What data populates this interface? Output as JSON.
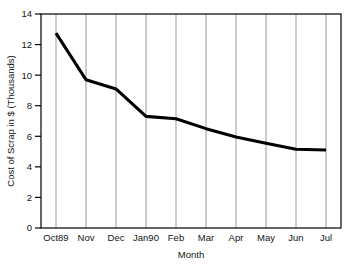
{
  "chart_data": {
    "type": "line",
    "title": "",
    "subtitle": "",
    "xlabel": "Month",
    "ylabel": "Cost of Scrap in $ (Thousands)",
    "categories": [
      "Oct89",
      "Nov",
      "Dec",
      "Jan90",
      "Feb",
      "Mar",
      "Apr",
      "May",
      "Jun",
      "Jul"
    ],
    "values": [
      12.75,
      9.7,
      9.1,
      7.3,
      7.15,
      6.5,
      5.95,
      5.55,
      5.15,
      5.1
    ],
    "series": [
      {
        "name": "Cost of Scrap",
        "values": [
          12.75,
          9.7,
          9.1,
          7.3,
          7.15,
          6.5,
          5.95,
          5.55,
          5.15,
          5.1
        ]
      }
    ],
    "ylim": [
      0,
      14
    ],
    "yticks": [
      0,
      2,
      4,
      6,
      8,
      10,
      12,
      14
    ],
    "ytick_labels": [
      "0",
      "2",
      "4",
      "6",
      "8",
      "10",
      "12",
      "14"
    ],
    "xtick_labels": [
      "Oct89",
      "Nov",
      "Dec",
      "Jan90",
      "Feb",
      "Mar",
      "Apr",
      "May",
      "Jun",
      "Jul"
    ],
    "grid": {
      "vertical": true,
      "horizontal": false
    },
    "legend": {
      "visible": false,
      "position": "none"
    },
    "line_color": "#000000",
    "grid_color": "#9a9a9a",
    "axis_color": "#000000",
    "background_color": "#ffffff"
  }
}
